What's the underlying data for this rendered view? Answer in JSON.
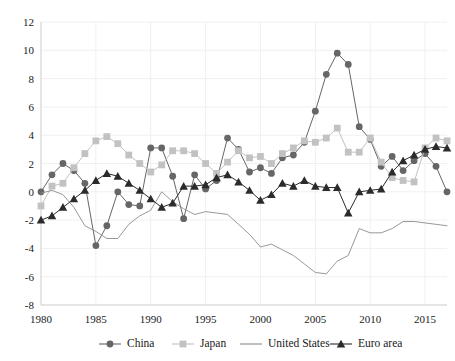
{
  "chart_data": {
    "type": "line",
    "title": "",
    "subtitle": "",
    "xlabel": "",
    "ylabel": "",
    "xlim": [
      1980,
      2017
    ],
    "ylim": [
      -8,
      12
    ],
    "ytick_labels": [
      "12",
      "10",
      "8",
      "6",
      "4",
      "2",
      "0",
      "-2",
      "-4",
      "-6",
      "-8"
    ],
    "ytick_values": [
      12,
      10,
      8,
      6,
      4,
      2,
      0,
      -2,
      -4,
      -6,
      -8
    ],
    "xtick_labels": [
      "1980",
      "1985",
      "1990",
      "1995",
      "2000",
      "2005",
      "2010",
      "2015"
    ],
    "xtick_values": [
      1980,
      1985,
      1990,
      1995,
      2000,
      2005,
      2010,
      2015
    ],
    "grid": true,
    "legend_position": "bottom",
    "x": [
      1980,
      1981,
      1982,
      1983,
      1984,
      1985,
      1986,
      1987,
      1988,
      1989,
      1990,
      1991,
      1992,
      1993,
      1994,
      1995,
      1996,
      1997,
      1998,
      1999,
      2000,
      2001,
      2002,
      2003,
      2004,
      2005,
      2006,
      2007,
      2008,
      2009,
      2010,
      2011,
      2012,
      2013,
      2014,
      2015,
      2016,
      2017
    ],
    "series": [
      {
        "name": "China",
        "color": "#666666",
        "marker": "circle",
        "values": [
          0.0,
          1.2,
          2.0,
          1.5,
          0.6,
          -3.8,
          -2.4,
          0.0,
          -0.9,
          -1.0,
          3.1,
          3.1,
          1.1,
          -1.9,
          1.2,
          0.2,
          0.8,
          3.8,
          3.0,
          1.4,
          1.7,
          1.3,
          2.4,
          2.6,
          3.5,
          5.7,
          8.3,
          9.8,
          9.0,
          4.6,
          3.7,
          1.8,
          2.5,
          1.5,
          2.2,
          2.7,
          1.8,
          0.0
        ]
      },
      {
        "name": "Japan",
        "color": "#c2c2c2",
        "marker": "square",
        "values": [
          -1.0,
          0.4,
          0.6,
          1.7,
          2.7,
          3.6,
          3.9,
          3.4,
          2.6,
          2.0,
          1.4,
          1.9,
          2.9,
          2.9,
          2.7,
          2.0,
          1.3,
          2.1,
          2.9,
          2.4,
          2.5,
          2.0,
          2.7,
          3.1,
          3.6,
          3.5,
          3.8,
          4.5,
          2.8,
          2.8,
          3.8,
          2.1,
          1.0,
          0.8,
          0.7,
          3.1,
          3.8,
          3.6
        ]
      },
      {
        "name": "United States",
        "color": "#8c8c8c",
        "marker": "none",
        "values": [
          -0.1,
          0.1,
          -0.2,
          -1.1,
          -2.4,
          -2.8,
          -3.3,
          -3.3,
          -2.3,
          -1.7,
          -1.3,
          0.0,
          -0.7,
          -1.2,
          -1.6,
          -1.4,
          -1.5,
          -1.6,
          -2.3,
          -3.0,
          -3.9,
          -3.7,
          -4.1,
          -4.5,
          -5.1,
          -5.7,
          -5.8,
          -4.9,
          -4.5,
          -2.6,
          -2.9,
          -2.9,
          -2.6,
          -2.1,
          -2.1,
          -2.2,
          -2.3,
          -2.4
        ]
      },
      {
        "name": "Euro area",
        "color": "#2b2b2b",
        "marker": "triangle",
        "values": [
          -2.0,
          -1.7,
          -1.1,
          -0.5,
          0.1,
          0.8,
          1.3,
          1.1,
          0.6,
          0.1,
          -0.5,
          -1.1,
          -0.8,
          0.4,
          0.4,
          0.5,
          1.0,
          1.2,
          0.7,
          0.1,
          -0.6,
          -0.2,
          0.6,
          0.4,
          0.8,
          0.4,
          0.3,
          0.3,
          -1.5,
          0.0,
          0.1,
          0.2,
          1.4,
          2.2,
          2.6,
          3.0,
          3.2,
          3.1
        ]
      }
    ]
  },
  "legend": {
    "items": [
      {
        "label": "China"
      },
      {
        "label": "Japan"
      },
      {
        "label": "United States"
      },
      {
        "label": "Euro area"
      }
    ]
  }
}
